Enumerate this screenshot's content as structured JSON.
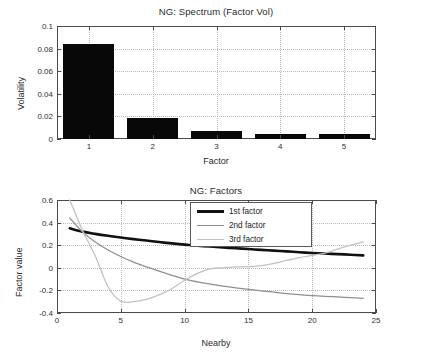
{
  "chart_data": [
    {
      "type": "bar",
      "title": "NG: Spectrum (Factor Vol)",
      "xlabel": "Factor",
      "ylabel": "Volatility",
      "categories": [
        "1",
        "2",
        "3",
        "4",
        "5"
      ],
      "values": [
        0.0843,
        0.0189,
        0.0075,
        0.0045,
        0.004
      ],
      "ylim": [
        0,
        0.1
      ],
      "yticks": [
        0,
        0.02,
        0.04,
        0.06,
        0.08,
        0.1
      ],
      "ytick_labels": [
        "0",
        "0.02",
        "0.04",
        "0.06",
        "0.08",
        "0.1"
      ],
      "xlim": [
        0.5,
        5.5
      ],
      "xticks": [
        1,
        2,
        3,
        4,
        5
      ],
      "xtick_labels": [
        "1",
        "2",
        "3",
        "4",
        "5"
      ],
      "grid": true,
      "bar_color": "#080808",
      "legend": null
    },
    {
      "type": "line",
      "title": "NG: Factors",
      "xlabel": "Nearby",
      "ylabel": "Factor value",
      "ylim": [
        -0.4,
        0.6
      ],
      "yticks": [
        -0.4,
        -0.2,
        0,
        0.2,
        0.4,
        0.6
      ],
      "ytick_labels": [
        "-0.4",
        "-0.2",
        "0",
        "0.2",
        "0.4",
        "0.6"
      ],
      "xlim": [
        0,
        25
      ],
      "xticks": [
        0,
        5,
        10,
        15,
        20,
        25
      ],
      "xtick_labels": [
        "0",
        "5",
        "10",
        "15",
        "20",
        "25"
      ],
      "grid": true,
      "legend_position": "top-center",
      "series": [
        {
          "name": "1st factor",
          "color": "#111111",
          "width": 2.6,
          "x": [
            1,
            2,
            3,
            4,
            5,
            6,
            7,
            8,
            9,
            10,
            11,
            12,
            13,
            14,
            15,
            16,
            17,
            18,
            19,
            20,
            21,
            22,
            23,
            24
          ],
          "values": [
            0.35,
            0.32,
            0.3,
            0.283,
            0.268,
            0.254,
            0.241,
            0.228,
            0.216,
            0.205,
            0.196,
            0.188,
            0.18,
            0.173,
            0.166,
            0.159,
            0.152,
            0.145,
            0.138,
            0.131,
            0.126,
            0.121,
            0.116,
            0.11
          ]
        },
        {
          "name": "2nd factor",
          "color": "#8f8f8f",
          "width": 1.3,
          "x": [
            1,
            2,
            3,
            4,
            5,
            6,
            7,
            8,
            9,
            10,
            11,
            12,
            13,
            14,
            15,
            16,
            17,
            18,
            19,
            20,
            21,
            22,
            23,
            24
          ],
          "values": [
            0.44,
            0.318,
            0.228,
            0.158,
            0.1,
            0.05,
            0.008,
            -0.03,
            -0.066,
            -0.1,
            -0.124,
            -0.144,
            -0.162,
            -0.177,
            -0.191,
            -0.204,
            -0.216,
            -0.228,
            -0.238,
            -0.246,
            -0.252,
            -0.258,
            -0.264,
            -0.27
          ]
        },
        {
          "name": "3rd factor",
          "color": "#c2c2c2",
          "width": 1.3,
          "x": [
            1,
            2,
            3,
            4,
            5,
            6,
            7,
            8,
            9,
            10,
            11,
            12,
            13,
            14,
            15,
            16,
            17,
            18,
            19,
            20,
            21,
            22,
            23,
            24
          ],
          "values": [
            0.6,
            0.33,
            0.105,
            -0.17,
            -0.295,
            -0.3,
            -0.28,
            -0.24,
            -0.185,
            -0.11,
            -0.05,
            -0.01,
            0.0,
            0.008,
            0.01,
            0.02,
            0.04,
            0.065,
            0.09,
            0.11,
            0.13,
            0.165,
            0.2,
            0.23
          ]
        }
      ]
    }
  ]
}
